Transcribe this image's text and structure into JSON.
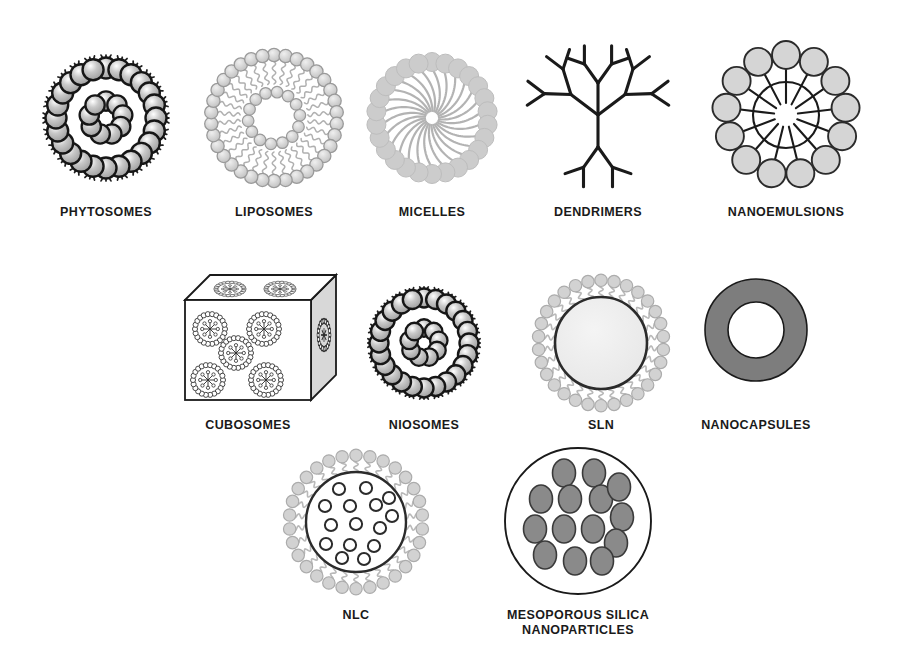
{
  "figure": {
    "background": "#ffffff",
    "width": 908,
    "height": 669
  },
  "palette": {
    "ink": "#1a1a1a",
    "outline_dark": "#2b2b2b",
    "head_light": "#cfcfcf",
    "head_light_stroke": "#9a9a9a",
    "head_pale": "#d9d9d9",
    "head_pale_stroke": "#b5b5b5",
    "head_white": "#f2f2f2",
    "core_pale": "#ededed",
    "fill_mid_gray": "#8a8a8a",
    "fill_ring_gray": "#7d7d7d",
    "cube_shade": "#d8d8d8",
    "tail_gray": "#b0b0b0",
    "label_color": "#1a1a1a"
  },
  "items": [
    {
      "id": "phytosomes",
      "label": "PHYTOSOMES",
      "row": 1,
      "cx": 106,
      "cy": 118,
      "label_x": 106,
      "label_y": 212,
      "structure": "vesicle-dark-heads-with-inner-cluster",
      "outer_heads": 24,
      "inner_heads": 9,
      "radius": 62
    },
    {
      "id": "liposomes",
      "label": "LIPOSOMES",
      "row": 1,
      "cx": 274,
      "cy": 118,
      "label_x": 274,
      "label_y": 212,
      "structure": "bilayer-vesicle",
      "outer_heads": 34,
      "inner_heads": 14,
      "radius": 70
    },
    {
      "id": "micelles",
      "label": "MICELLES",
      "row": 1,
      "cx": 432,
      "cy": 118,
      "label_x": 432,
      "label_y": 212,
      "structure": "monolayer-micelle-spiral-tails",
      "outer_heads": 26,
      "radius": 65
    },
    {
      "id": "dendrimers",
      "label": "DENDRIMERS",
      "row": 1,
      "cx": 598,
      "cy": 115,
      "label_x": 598,
      "label_y": 212,
      "structure": "branched-tree",
      "generations": 3,
      "core_branches": 3
    },
    {
      "id": "nanoemulsions",
      "label": "NANOEMULSIONS",
      "row": 1,
      "cx": 786,
      "cy": 115,
      "label_x": 786,
      "label_y": 212,
      "structure": "core-with-radial-spokes-and-droplets",
      "spokes": 13,
      "core_radius": 33,
      "droplet_radius": 14
    },
    {
      "id": "cubosomes",
      "label": "CUBOSOMES",
      "row": 2,
      "cx": 248,
      "cy": 347,
      "label_x": 248,
      "label_y": 425,
      "structure": "perspective-cube-with-vesicles",
      "vesicles_front": 5,
      "vesicles_top": 2,
      "vesicles_side": 1
    },
    {
      "id": "niosomes",
      "label": "NIOSOMES",
      "row": 2,
      "cx": 424,
      "cy": 343,
      "label_x": 424,
      "label_y": 425,
      "structure": "vesicle-dark-heads-with-inner-cluster",
      "outer_heads": 24,
      "inner_heads": 9,
      "radius": 56
    },
    {
      "id": "sln",
      "label": "SLN",
      "row": 2,
      "cx": 601,
      "cy": 343,
      "label_x": 601,
      "label_y": 425,
      "structure": "solid-core-with-surfactant-corona",
      "heads": 30,
      "core_radius": 46
    },
    {
      "id": "nanocapsules",
      "label": "NANOCAPSULES",
      "row": 2,
      "cx": 756,
      "cy": 330,
      "label_x": 756,
      "label_y": 425,
      "structure": "thick-gray-annulus",
      "outer_radius": 51,
      "inner_radius": 28
    },
    {
      "id": "nlc",
      "label": "NLC",
      "row": 3,
      "cx": 356,
      "cy": 522,
      "label_x": 356,
      "label_y": 615,
      "structure": "core-with-droplets-and-surfactant-corona",
      "heads": 30,
      "core_radius": 50,
      "droplets": 15
    },
    {
      "id": "mesoporous-silica",
      "label": "MESOPOROUS SILICA\nNANOPARTICLES",
      "row": 3,
      "cx": 578,
      "cy": 521,
      "label_x": 578,
      "label_y": 615,
      "structure": "circle-with-gray-pores",
      "pores": 14,
      "radius": 73
    }
  ]
}
